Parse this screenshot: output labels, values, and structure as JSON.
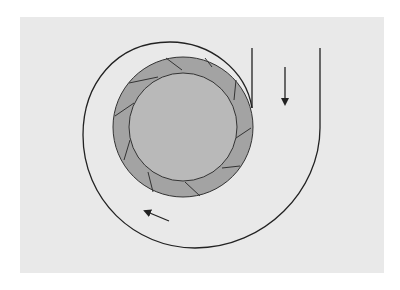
{
  "diagram": {
    "type": "centrifugal-impeller-volute",
    "colors": {
      "background": "#ffffff",
      "panel": "#e9e9e9",
      "impeller_ring": "#a3a3a3",
      "hub": "#b9b9b9",
      "stroke": "#222222"
    },
    "impeller": {
      "center": [
        183,
        127
      ],
      "outer_radius": 71,
      "inner_radius": 54,
      "blade_count": 10
    },
    "flow_arrows": [
      {
        "name": "outlet-flow-arrow",
        "direction": "down"
      },
      {
        "name": "volute-flow-arrow",
        "direction": "up-left"
      }
    ]
  }
}
